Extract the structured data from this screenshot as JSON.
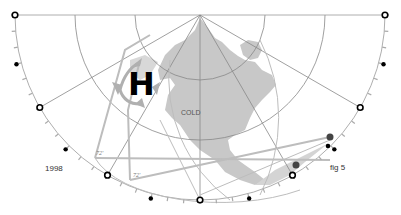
{
  "figure": {
    "year_label": "1998",
    "figure_label": "fig 5",
    "pressure_label": "H",
    "region_label": "COLD",
    "angle_labels": [
      "72'",
      "72'"
    ]
  },
  "geometry": {
    "center": [
      200,
      15
    ],
    "outer_radius": 185,
    "inner_radii": [
      65,
      125
    ],
    "spoke_angles_deg": [
      0,
      30,
      60,
      90,
      120,
      150,
      180
    ],
    "open_markers_deg": [
      0,
      30,
      60,
      90,
      120,
      150,
      180
    ],
    "filled_markers_deg": [
      15,
      45,
      105,
      165
    ]
  },
  "colors": {
    "land": "#c8c8c8",
    "line": "#888888",
    "arrow": "#b0b0b0",
    "marker": "#000000",
    "tick": "#aaaaaa"
  }
}
